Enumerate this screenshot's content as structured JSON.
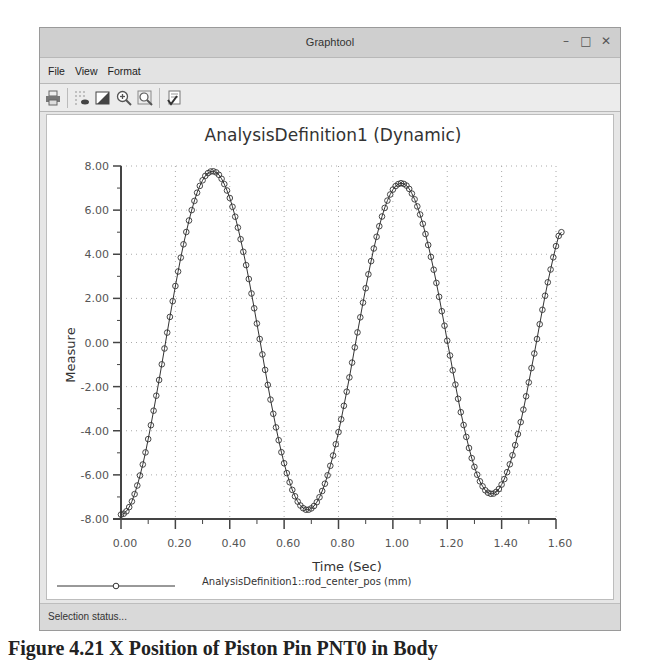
{
  "window": {
    "title": "Graphtool",
    "controls": {
      "minimize": "–",
      "maximize": "□",
      "close": "✕"
    }
  },
  "menu": {
    "items": [
      {
        "label": "File"
      },
      {
        "label": "View"
      },
      {
        "label": "Format"
      }
    ]
  },
  "toolbar": {
    "buttons": [
      {
        "name": "print-icon"
      },
      {
        "name": "toggle-grid-icon"
      },
      {
        "name": "background-color-icon"
      },
      {
        "name": "zoom-in-icon"
      },
      {
        "name": "refit-icon"
      },
      {
        "name": "format-graph-icon"
      }
    ]
  },
  "status": {
    "text": "Selection status..."
  },
  "caption": {
    "text": "Figure 4.21  X Position of Piston Pin PNT0 in Body"
  },
  "chart_data": {
    "type": "line",
    "title": "AnalysisDefinition1 (Dynamic)",
    "xlabel": "Time (Sec)",
    "ylabel": "Measure",
    "xlim": [
      0,
      1.6
    ],
    "ylim": [
      -8,
      8
    ],
    "x_ticks": [
      "0.00",
      "0.20",
      "0.40",
      "0.60",
      "0.80",
      "1.00",
      "1.20",
      "1.40",
      "1.60"
    ],
    "y_ticks": [
      "8.00",
      "6.00",
      "4.00",
      "2.00",
      "0.00",
      "-2.00",
      "-4.00",
      "-6.00",
      "-8.00"
    ],
    "grid": true,
    "legend_position": "bottom",
    "marker": "circle",
    "series": [
      {
        "name": "AnalysisDefinition1::rod_center_pos (mm)",
        "color": "#333333",
        "x_start": 0.0,
        "x_step": 0.01,
        "values": [
          -7.8,
          -7.76,
          -7.65,
          -7.46,
          -7.2,
          -6.87,
          -6.48,
          -6.03,
          -5.53,
          -4.98,
          -4.38,
          -3.75,
          -3.09,
          -2.41,
          -1.7,
          -0.99,
          -0.27,
          0.45,
          1.16,
          1.87,
          2.56,
          3.22,
          3.85,
          4.45,
          5.01,
          5.53,
          6.0,
          6.42,
          6.79,
          7.1,
          7.35,
          7.55,
          7.68,
          7.75,
          7.76,
          7.71,
          7.6,
          7.42,
          7.18,
          6.89,
          6.55,
          6.15,
          5.7,
          5.21,
          4.68,
          4.11,
          3.51,
          2.88,
          2.22,
          1.55,
          0.86,
          0.16,
          -0.54,
          -1.24,
          -1.92,
          -2.59,
          -3.23,
          -3.85,
          -4.43,
          -4.97,
          -5.47,
          -5.92,
          -6.33,
          -6.68,
          -6.97,
          -7.21,
          -7.39,
          -7.51,
          -7.58,
          -7.58,
          -7.52,
          -7.41,
          -7.24,
          -7.01,
          -6.73,
          -6.4,
          -6.02,
          -5.59,
          -5.12,
          -4.61,
          -4.06,
          -3.48,
          -2.87,
          -2.23,
          -1.58,
          -0.91,
          -0.22,
          0.46,
          1.14,
          1.81,
          2.46,
          3.09,
          3.69,
          4.26,
          4.79,
          5.27,
          5.71,
          6.1,
          6.43,
          6.71,
          6.93,
          7.09,
          7.18,
          7.22,
          7.19,
          7.11,
          6.96,
          6.75,
          6.49,
          6.17,
          5.8,
          5.38,
          4.92,
          4.42,
          3.88,
          3.3,
          2.7,
          2.07,
          1.42,
          0.76,
          0.08,
          -0.59,
          -1.26,
          -1.91,
          -2.55,
          -3.16,
          -3.74,
          -4.28,
          -4.78,
          -5.24,
          -5.64,
          -5.99,
          -6.29,
          -6.52,
          -6.7,
          -6.81,
          -6.86,
          -6.85,
          -6.77,
          -6.64,
          -6.44,
          -6.19,
          -5.88,
          -5.52,
          -5.11,
          -4.65,
          -4.15,
          -3.61,
          -3.04,
          -2.44,
          -1.81,
          -1.16,
          -0.5,
          0.16,
          0.83,
          1.48,
          2.12,
          2.73,
          3.31,
          3.86,
          4.37,
          4.83,
          5.0
        ]
      }
    ]
  }
}
